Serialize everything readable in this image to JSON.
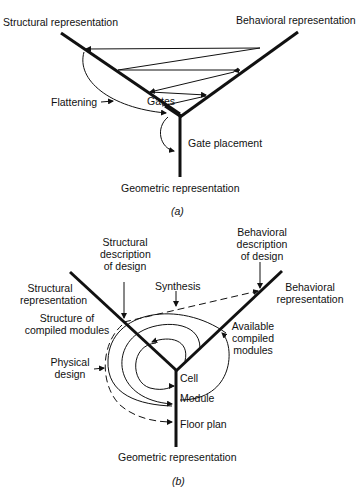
{
  "diagram_a": {
    "caption": "(a)",
    "axes": {
      "structural": "Structural representation",
      "behavioral": "Behavioral representation",
      "geometric": "Geometric representation"
    },
    "labels": {
      "flattening": "Flattening",
      "gates": "Gates",
      "gate_placement": "Gate placement"
    }
  },
  "diagram_b": {
    "caption": "(b)",
    "axes": {
      "structural_l1": "Structural",
      "structural_l2": "representation",
      "behavioral_l1": "Behavioral",
      "behavioral_l2": "representation",
      "geometric": "Geometric representation"
    },
    "labels": {
      "structural_desc_l1": "Structural",
      "structural_desc_l2": "description",
      "structural_desc_l3": "of design",
      "behavioral_desc_l1": "Behavioral",
      "behavioral_desc_l2": "description",
      "behavioral_desc_l3": "of design",
      "synthesis": "Synthesis",
      "structure_compiled_l1": "Structure of",
      "structure_compiled_l2": "compiled modules",
      "available_l1": "Available",
      "available_l2": "compiled",
      "available_l3": "modules",
      "physical_l1": "Physical",
      "physical_l2": "design",
      "cell": "Cell",
      "module": "Module",
      "floor_plan": "Floor plan"
    }
  }
}
